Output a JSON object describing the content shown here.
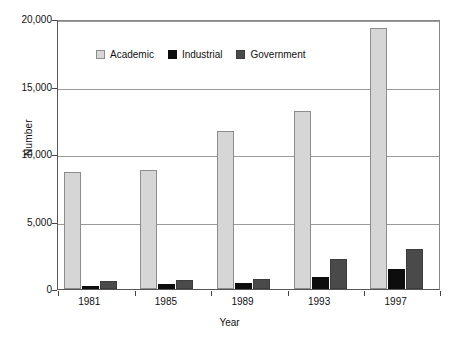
{
  "chart_data": {
    "type": "bar",
    "title": "",
    "xlabel": "Year",
    "ylabel": "Number",
    "categories": [
      "1981",
      "1985",
      "1989",
      "1993",
      "1997"
    ],
    "series": [
      {
        "name": "Academic",
        "color": "#d6d6d6",
        "values": [
          8700,
          8800,
          11700,
          13200,
          19300
        ]
      },
      {
        "name": "Industrial",
        "color": "#0d0d0d",
        "values": [
          200,
          400,
          450,
          900,
          1500
        ]
      },
      {
        "name": "Government",
        "color": "#4a4a4a",
        "values": [
          600,
          700,
          750,
          2200,
          3000
        ]
      }
    ],
    "ylim": [
      0,
      20000
    ],
    "yticks": [
      0,
      5000,
      10000,
      15000,
      20000
    ],
    "ytick_labels": [
      "0",
      "5,000",
      "10,000",
      "15,000",
      "20,000"
    ],
    "grid": true,
    "legend_position": "top-left-inside"
  },
  "legend": {
    "items": [
      {
        "label": "Academic",
        "swatch": "academic-swatch"
      },
      {
        "label": "Industrial",
        "swatch": "industrial-swatch"
      },
      {
        "label": "Government",
        "swatch": "government-swatch"
      }
    ]
  },
  "axes": {
    "y_title": "Number",
    "x_title": "Year"
  }
}
